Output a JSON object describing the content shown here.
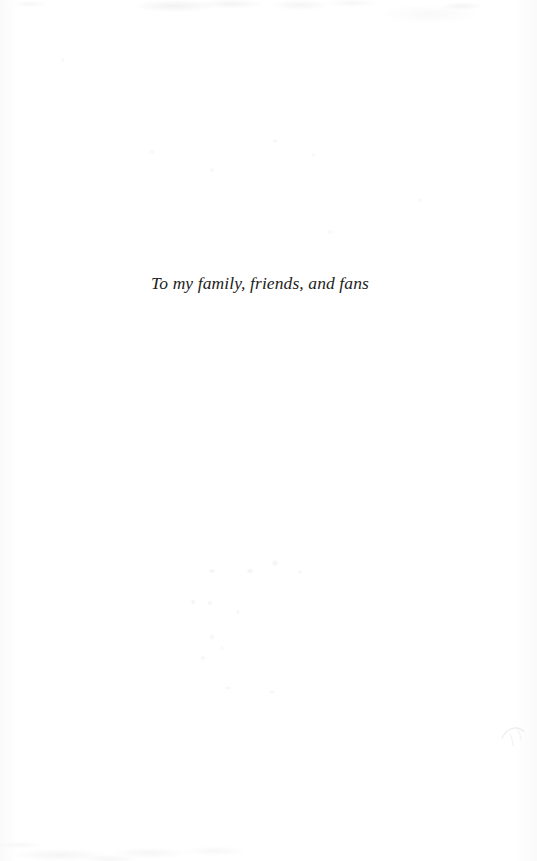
{
  "page": {
    "kind": "book-dedication-page",
    "background_color": "#fefefe",
    "ink_color": "#1d1d21",
    "width": 537,
    "height": 861
  },
  "dedication": {
    "text": "To my family, friends, and fans"
  },
  "artifacts": {
    "smudge_icon": "scan-smudge-icon",
    "top_edge_noise": "scan-noise-top",
    "bottom_edge_noise": "scan-noise-bottom",
    "left_edge_noise": "scan-noise-left",
    "right_edge_noise": "scan-noise-right",
    "showthrough": "page-showthrough-specks"
  }
}
